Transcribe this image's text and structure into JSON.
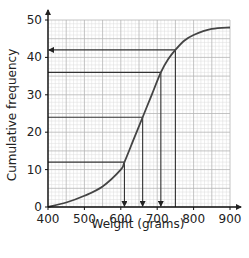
{
  "chart_data": {
    "type": "line",
    "title": "",
    "xlabel": "Weight (grams)",
    "ylabel": "Cumulative frequency",
    "xlim": [
      400,
      900
    ],
    "ylim": [
      0,
      50
    ],
    "x_ticks": [
      400,
      500,
      600,
      700,
      800,
      900
    ],
    "y_ticks": [
      0,
      10,
      20,
      30,
      40,
      50
    ],
    "grid": true,
    "legend": null,
    "series": [
      {
        "name": "Cumulative frequency curve",
        "x": [
          400,
          450,
          500,
          550,
          600,
          610,
          635,
          660,
          685,
          710,
          730,
          750,
          775,
          800,
          850,
          900
        ],
        "y": [
          0,
          1.2,
          3,
          5.5,
          10,
          12,
          18,
          24,
          30,
          36,
          39.5,
          42,
          44.5,
          46,
          47.6,
          48
        ]
      }
    ],
    "reading_lines": [
      {
        "cf": 12,
        "weight": 610,
        "direction": "down-to-x"
      },
      {
        "cf": 24,
        "weight": 660,
        "direction": "down-to-x"
      },
      {
        "cf": 36,
        "weight": 710,
        "direction": "down-to-x"
      },
      {
        "cf": 42,
        "weight": 750,
        "direction": "left-to-y"
      }
    ],
    "colors": {
      "curve": "#444444",
      "grid_major": "#b5b5b5",
      "grid_minor": "#dddddd",
      "axis": "#111111"
    }
  }
}
